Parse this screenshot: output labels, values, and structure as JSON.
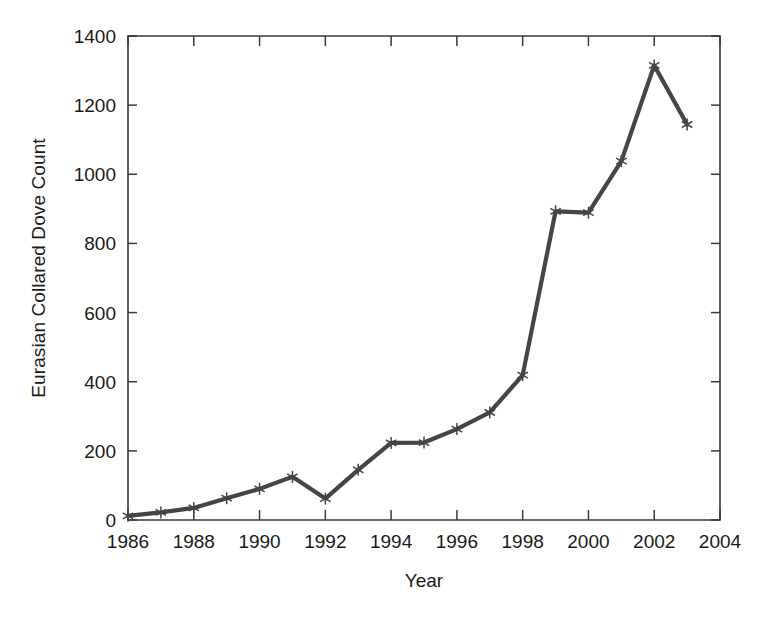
{
  "chart_data": {
    "type": "line",
    "title": "",
    "xlabel": "Year",
    "ylabel": "Eurasian Collared Dove Count",
    "x": [
      1986,
      1987,
      1988,
      1989,
      1990,
      1991,
      1992,
      1993,
      1994,
      1995,
      1996,
      1997,
      1998,
      1999,
      2000,
      2001,
      2002,
      2003
    ],
    "values": [
      12,
      22,
      35,
      63,
      90,
      125,
      62,
      145,
      223,
      224,
      263,
      311,
      419,
      893,
      889,
      1038,
      1315,
      1144
    ],
    "series": [
      {
        "name": "Eurasian Collared Dove Count",
        "values": [
          12,
          22,
          35,
          63,
          90,
          125,
          62,
          145,
          223,
          224,
          263,
          311,
          419,
          893,
          889,
          1038,
          1315,
          1144
        ]
      }
    ],
    "xlim": [
      1986,
      2004
    ],
    "ylim": [
      0,
      1400
    ],
    "xticks": [
      1986,
      1988,
      1990,
      1992,
      1994,
      1996,
      1998,
      2000,
      2002,
      2004
    ],
    "xtick_labels": [
      "1986",
      "1988",
      "1990",
      "1992",
      "1994",
      "1996",
      "1998",
      "2000",
      "2002",
      "2004"
    ],
    "yticks": [
      0,
      200,
      400,
      600,
      800,
      1000,
      1200,
      1400
    ],
    "ytick_labels": [
      "0",
      "200",
      "400",
      "600",
      "800",
      "1000",
      "1200",
      "1400"
    ],
    "grid": false,
    "legend": "none",
    "marker": "asterisk",
    "line_color": "#454545",
    "marker_color": "#454545",
    "axis_color": "#3a3a3a",
    "background_color": "#ffffff"
  }
}
